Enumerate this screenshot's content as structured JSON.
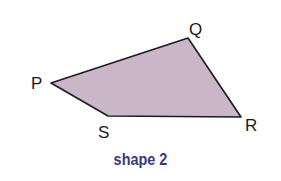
{
  "diagram": {
    "type": "quadrilateral",
    "fill_color": "#c9b6c8",
    "stroke_color": "#1c1c1c",
    "vertices": [
      {
        "label": "P",
        "x": 51,
        "y": 83,
        "label_x": 31,
        "label_y": 89
      },
      {
        "label": "Q",
        "x": 188,
        "y": 38,
        "label_x": 189,
        "label_y": 35
      },
      {
        "label": "R",
        "x": 241,
        "y": 117,
        "label_x": 245,
        "label_y": 131
      },
      {
        "label": "S",
        "x": 108,
        "y": 116,
        "label_x": 98,
        "label_y": 138
      }
    ],
    "caption": "shape 2",
    "caption_color": "#3b3a78"
  }
}
